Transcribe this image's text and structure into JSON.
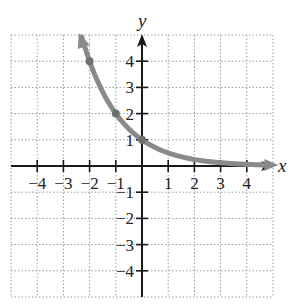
{
  "chart_data": {
    "type": "line",
    "title": "",
    "xlabel": "x",
    "ylabel": "y",
    "xlim": [
      -5,
      5
    ],
    "ylim": [
      -5,
      5
    ],
    "grid": true,
    "grid_style": "dotted",
    "x_ticks": [
      -4,
      -3,
      -2,
      -1,
      1,
      2,
      3,
      4
    ],
    "y_ticks": [
      4,
      3,
      2,
      1,
      -1,
      -2,
      -3,
      -4
    ],
    "x_tick_labels": [
      "−4",
      "−3",
      "−2",
      "−1",
      "1",
      "2",
      "3",
      "4"
    ],
    "y_tick_labels": [
      "4",
      "3",
      "2",
      "1",
      "−1",
      "−2",
      "−3",
      "−4"
    ],
    "series": [
      {
        "name": "y = (1/2)^x",
        "function": "0.5^x",
        "x_range": [
          -2.3,
          4.9
        ],
        "marked_points": [
          {
            "x": -2,
            "y": 4
          },
          {
            "x": -1,
            "y": 2
          },
          {
            "x": 0,
            "y": 1
          }
        ],
        "color": "#8a8a8a",
        "arrows": "both"
      }
    ],
    "legend": null
  },
  "colors": {
    "axis": "#1a1a1a",
    "grid": "#9a9a9a",
    "curve": "#8a8a8a"
  }
}
